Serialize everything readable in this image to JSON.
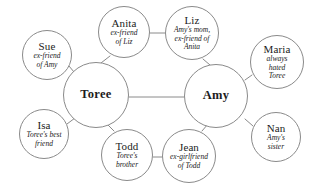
{
  "diagram": {
    "type": "social-network-bubble-diagram",
    "background_color": "#ffffff",
    "stroke_color": "#8a8a8a",
    "text_color": "#1c1c1c",
    "hubs": [
      {
        "id": "toree",
        "name": "Toree",
        "description": "",
        "cx": 96,
        "cy": 95,
        "r": 33
      },
      {
        "id": "amy",
        "name": "Amy",
        "description": "",
        "cx": 216,
        "cy": 96,
        "r": 32
      }
    ],
    "satellites": [
      {
        "id": "anita",
        "name": "Anita",
        "description": "ex-friend\nof Liz",
        "cx": 124,
        "cy": 32,
        "r": 26
      },
      {
        "id": "liz",
        "name": "Liz",
        "description": "Amy's mom,\nex-friend of\nAnita",
        "cx": 192,
        "cy": 33,
        "r": 27
      },
      {
        "id": "sue",
        "name": "Sue",
        "description": "ex-friend\nof Amy",
        "cx": 47,
        "cy": 55,
        "r": 25
      },
      {
        "id": "maria",
        "name": "Maria",
        "description": "always\nhated\nToree",
        "cx": 277,
        "cy": 62,
        "r": 27
      },
      {
        "id": "isa",
        "name": "Isa",
        "description": "Toree's best\nfriend",
        "cx": 44,
        "cy": 134,
        "r": 25
      },
      {
        "id": "nan",
        "name": "Nan",
        "description": "Amy's\nsister",
        "cx": 276,
        "cy": 137,
        "r": 25
      },
      {
        "id": "todd",
        "name": "Todd",
        "description": "Toree's\nbrother",
        "cx": 127,
        "cy": 155,
        "r": 26
      },
      {
        "id": "jean",
        "name": "Jean",
        "description": "ex-girlfriend\nof Todd",
        "cx": 189,
        "cy": 156,
        "r": 27
      }
    ],
    "links": [
      {
        "id": "toree-amy",
        "from": "Toree",
        "to": "Amy",
        "x1": 129,
        "y1": 97,
        "x2": 184,
        "y2": 97
      },
      {
        "id": "anita-liz",
        "from": "Anita",
        "to": "Liz",
        "x1": 150,
        "y1": 33,
        "x2": 165,
        "y2": 33
      },
      {
        "id": "todd-jean",
        "from": "Todd",
        "to": "Jean",
        "x1": 153,
        "y1": 157,
        "x2": 162,
        "y2": 157
      },
      {
        "id": "anita-toree",
        "from": "Anita",
        "to": "Toree",
        "x1": 110,
        "y1": 56,
        "x2": 101,
        "y2": 63
      },
      {
        "id": "liz-amy",
        "from": "Liz",
        "to": "Amy",
        "x1": 203,
        "y1": 59,
        "x2": 210,
        "y2": 65
      },
      {
        "id": "sue-toree",
        "from": "Sue",
        "to": "Toree",
        "x1": 69,
        "y1": 66,
        "x2": 74,
        "y2": 72
      },
      {
        "id": "maria-amy",
        "from": "Maria",
        "to": "Amy",
        "x1": 252,
        "y1": 75,
        "x2": 245,
        "y2": 80
      },
      {
        "id": "isa-toree",
        "from": "Isa",
        "to": "Toree",
        "x1": 67,
        "y1": 124,
        "x2": 75,
        "y2": 118
      },
      {
        "id": "nan-amy",
        "from": "Nan",
        "to": "Amy",
        "x1": 253,
        "y1": 126,
        "x2": 245,
        "y2": 119
      },
      {
        "id": "todd-toree",
        "from": "Todd",
        "to": "Toree",
        "x1": 114,
        "y1": 131,
        "x2": 107,
        "y2": 124
      },
      {
        "id": "jean-amy",
        "from": "Jean",
        "to": "Amy",
        "x1": 202,
        "y1": 131,
        "x2": 208,
        "y2": 124
      }
    ]
  }
}
